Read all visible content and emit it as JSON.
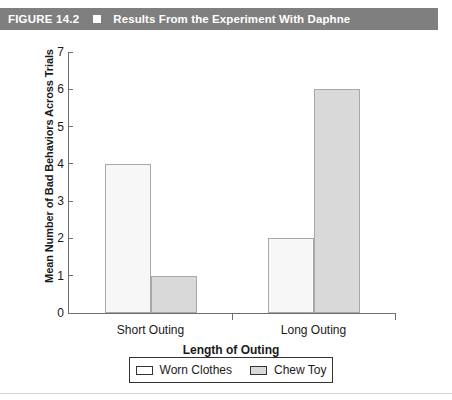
{
  "header": {
    "figure_number": "FIGURE 14.2",
    "marker_icon": "square-marker-icon",
    "title": "Results From the Experiment With Daphne",
    "background_color": "#7f7f7f",
    "text_color": "#ffffff"
  },
  "chart_data": {
    "type": "bar",
    "title": "Results From the Experiment With Daphne",
    "xlabel": "Length of Outing",
    "ylabel": "Mean Number of Bad Behaviors Across Trials",
    "categories": [
      "Short Outing",
      "Long Outing"
    ],
    "series": [
      {
        "name": "Worn Clothes",
        "values": [
          4,
          2
        ],
        "color": "#f7f7f7"
      },
      {
        "name": "Chew Toy",
        "values": [
          1,
          6
        ],
        "color": "#d9d9d9"
      }
    ],
    "ylim": [
      0,
      7
    ],
    "yticks": [
      0,
      1,
      2,
      3,
      4,
      5,
      6,
      7
    ],
    "ytick_labels": [
      "0",
      "1",
      "2",
      "3",
      "4",
      "5",
      "6",
      "7"
    ],
    "grid": false,
    "legend_position": "bottom"
  },
  "legend": {
    "entries": [
      {
        "label": "Worn Clothes",
        "swatch": "worn-clothes-swatch"
      },
      {
        "label": "Chew Toy",
        "swatch": "chew-toy-swatch"
      }
    ]
  }
}
